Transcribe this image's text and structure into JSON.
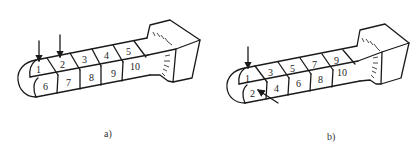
{
  "figures": [
    {
      "caption": "a)",
      "top_row_labels": [
        "1",
        "2",
        "3",
        "4",
        "5"
      ],
      "bottom_row_labels": [
        "6",
        "7",
        "8",
        "9",
        "10"
      ],
      "arrows": [
        "arrow-into-cell-1",
        "arrow-into-cell-2"
      ]
    },
    {
      "caption": "b)",
      "top_row_labels": [
        "1",
        "3",
        "5",
        "7",
        "9"
      ],
      "bottom_row_labels": [
        "2",
        "4",
        "6",
        "8",
        "10"
      ],
      "arrows": [
        "arrow-into-cell-1",
        "arrow-into-cell-2"
      ]
    }
  ],
  "colors": {
    "line": "#1a1a1a",
    "background": "#ffffff"
  }
}
